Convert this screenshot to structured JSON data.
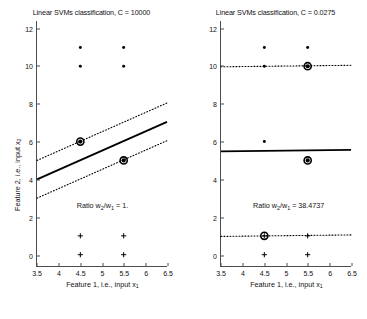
{
  "figure": {
    "width": 367,
    "height": 319,
    "background": "#ffffff"
  },
  "chart_data": [
    {
      "type": "scatter",
      "panel": "left",
      "title": "Linear SVMs classification, C = 10000",
      "xlabel": "Feature 1, i.e., input x1",
      "ylabel": "Feature 2, i.e., input x2",
      "xlim": [
        3.5,
        6.5
      ],
      "ylim": [
        -0.6,
        12.4
      ],
      "xticks": [
        3.5,
        4,
        4.5,
        5,
        5.5,
        6,
        6.5
      ],
      "xticklabels": [
        "3.5",
        "4",
        "4.5",
        "5",
        "5.5",
        "6",
        "6.5"
      ],
      "yticks": [
        0,
        2,
        4,
        6,
        8,
        10,
        12
      ],
      "yticklabels": [
        "0",
        "2",
        "4",
        "6",
        "8",
        "10",
        "12"
      ],
      "grid": false,
      "legend": null,
      "annotation": "Ratio w2/w1 = 1.",
      "annotation_position": [
        5.0,
        2.6
      ],
      "series": [
        {
          "name": "class-positive",
          "marker": "filled-circle",
          "color": "#000000",
          "points": [
            {
              "x": 4.5,
              "y": 11
            },
            {
              "x": 5.5,
              "y": 11
            },
            {
              "x": 4.5,
              "y": 10
            },
            {
              "x": 5.5,
              "y": 10
            },
            {
              "x": 4.5,
              "y": 6
            },
            {
              "x": 5.5,
              "y": 5
            }
          ]
        },
        {
          "name": "class-negative",
          "marker": "plus",
          "color": "#000000",
          "points": [
            {
              "x": 4.5,
              "y": 1
            },
            {
              "x": 5.5,
              "y": 1
            },
            {
              "x": 4.5,
              "y": 0
            },
            {
              "x": 5.5,
              "y": 0
            }
          ]
        },
        {
          "name": "support-vectors",
          "marker": "large-circle",
          "color": "#000000",
          "points": [
            {
              "x": 4.5,
              "y": 6
            },
            {
              "x": 5.5,
              "y": 5
            }
          ]
        }
      ],
      "lines": [
        {
          "name": "decision-boundary",
          "style": "solid",
          "color": "#000000",
          "width": 1.8,
          "from": {
            "x": 3.5,
            "y": 4.0
          },
          "to": {
            "x": 6.5,
            "y": 7.05
          }
        },
        {
          "name": "margin-upper",
          "style": "dotted",
          "color": "#000000",
          "width": 1.1,
          "from": {
            "x": 3.5,
            "y": 5.0
          },
          "to": {
            "x": 6.5,
            "y": 8.05
          }
        },
        {
          "name": "margin-lower",
          "style": "dotted",
          "color": "#000000",
          "width": 1.1,
          "from": {
            "x": 3.5,
            "y": 3.0
          },
          "to": {
            "x": 6.5,
            "y": 6.05
          }
        }
      ]
    },
    {
      "type": "scatter",
      "panel": "right",
      "title": "Linear SVMs classification, C = 0.0275",
      "xlabel": "Feature 1, i.e., input x1",
      "ylabel": "",
      "xlim": [
        3.5,
        6.5
      ],
      "ylim": [
        -0.6,
        12.4
      ],
      "xticks": [
        3.5,
        4,
        4.5,
        5,
        5.5,
        6,
        6.5
      ],
      "xticklabels": [
        "3.5",
        "4",
        "4.5",
        "5",
        "5.5",
        "6",
        "6.5"
      ],
      "yticks": [
        0,
        2,
        4,
        6,
        8,
        10,
        12
      ],
      "yticklabels": [
        "0",
        "2",
        "4",
        "6",
        "8",
        "10",
        "12"
      ],
      "grid": false,
      "legend": null,
      "annotation": "Ratio w2/w1 = 38.4737",
      "annotation_position": [
        5.05,
        2.6
      ],
      "series": [
        {
          "name": "class-positive",
          "marker": "filled-circle",
          "color": "#000000",
          "points": [
            {
              "x": 4.5,
              "y": 11
            },
            {
              "x": 5.5,
              "y": 11
            },
            {
              "x": 4.5,
              "y": 10
            },
            {
              "x": 5.5,
              "y": 10
            },
            {
              "x": 4.5,
              "y": 6
            },
            {
              "x": 5.5,
              "y": 5
            }
          ]
        },
        {
          "name": "class-negative",
          "marker": "plus",
          "color": "#000000",
          "points": [
            {
              "x": 4.5,
              "y": 1
            },
            {
              "x": 5.5,
              "y": 1
            },
            {
              "x": 4.5,
              "y": 0
            },
            {
              "x": 5.5,
              "y": 0
            }
          ]
        },
        {
          "name": "support-vectors",
          "marker": "large-circle",
          "color": "#000000",
          "points": [
            {
              "x": 5.5,
              "y": 10
            },
            {
              "x": 5.5,
              "y": 5
            },
            {
              "x": 4.5,
              "y": 1
            }
          ]
        }
      ],
      "lines": [
        {
          "name": "decision-boundary",
          "style": "solid",
          "color": "#000000",
          "width": 1.8,
          "from": {
            "x": 3.5,
            "y": 5.48
          },
          "to": {
            "x": 6.5,
            "y": 5.56
          }
        },
        {
          "name": "margin-upper",
          "style": "dotted",
          "color": "#000000",
          "width": 1.1,
          "from": {
            "x": 3.5,
            "y": 9.97
          },
          "to": {
            "x": 6.5,
            "y": 10.05
          }
        },
        {
          "name": "margin-lower",
          "style": "dotted",
          "color": "#000000",
          "width": 1.1,
          "from": {
            "x": 3.5,
            "y": 0.97
          },
          "to": {
            "x": 6.5,
            "y": 1.05
          }
        }
      ]
    }
  ]
}
